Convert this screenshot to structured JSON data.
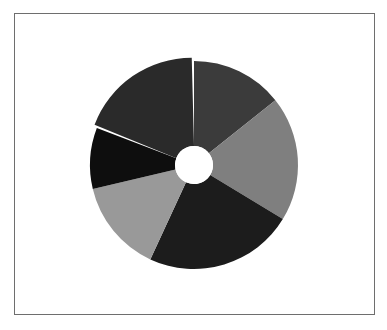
{
  "chart_data": {
    "type": "pie",
    "variant": "donut",
    "title": "",
    "legend": null,
    "start_angle_deg": 0,
    "direction": "clockwise",
    "center": [
      194,
      165
    ],
    "outer_radius": 104,
    "inner_radius": 19,
    "slices": [
      {
        "label": "",
        "value": 14.3,
        "color": "#3b3b3b",
        "exploded": false
      },
      {
        "label": "",
        "value": 19.4,
        "color": "#7f7f7f",
        "exploded": false
      },
      {
        "label": "",
        "value": 23.2,
        "color": "#1c1c1c",
        "exploded": false
      },
      {
        "label": "",
        "value": 14.4,
        "color": "#999999",
        "exploded": false
      },
      {
        "label": "",
        "value": 9.5,
        "color": "#0e0e0e",
        "exploded": false
      },
      {
        "label": "",
        "value": 19.2,
        "color": "#2a2a2a",
        "exploded": true
      }
    ]
  },
  "frame": {
    "border_color": "#6e6e6e"
  }
}
